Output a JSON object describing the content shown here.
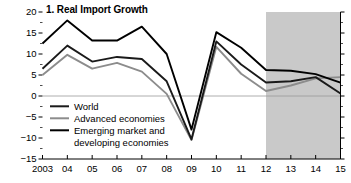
{
  "chart_data": {
    "type": "line",
    "title": "1. Real Import Growth",
    "xlabel": "",
    "ylabel": "",
    "x": [
      2003,
      2004,
      2005,
      2006,
      2007,
      2008,
      2009,
      2010,
      2011,
      2012,
      2013,
      2014,
      2015
    ],
    "xtick_labels": [
      "2003",
      "04",
      "05",
      "06",
      "07",
      "08",
      "09",
      "10",
      "11",
      "12",
      "13",
      "14",
      "15"
    ],
    "ytick_labels": [
      "20",
      "15",
      "10",
      "5",
      "0",
      "−5",
      "−10",
      "−15"
    ],
    "ytick_values": [
      20,
      15,
      10,
      5,
      0,
      -5,
      -10,
      -15
    ],
    "ylim": [
      -15,
      20
    ],
    "xlim": [
      2003,
      2015
    ],
    "grid": false,
    "minor_ticks": true,
    "legend_position": "inside-lower-left",
    "zero_line": true,
    "forecast_shading": {
      "label": "",
      "start": 2012,
      "end": 2015,
      "color": "#c9c9c9"
    },
    "series": [
      {
        "name": "World",
        "color": "#1a1a1a",
        "width": 1.9,
        "values": [
          6.5,
          12.0,
          8.2,
          9.3,
          8.8,
          3.5,
          -10.3,
          13.0,
          7.5,
          3.2,
          3.5,
          4.5,
          0.6
        ]
      },
      {
        "name": "Advanced economies",
        "color": "#8c8c8c",
        "width": 1.9,
        "values": [
          5.0,
          9.8,
          6.5,
          7.9,
          5.8,
          0.5,
          -10.5,
          11.7,
          5.3,
          1.2,
          2.5,
          4.2,
          4.5
        ]
      },
      {
        "name": "Emerging market and developing economies",
        "color": "#000000",
        "width": 1.9,
        "values": [
          12.5,
          18.0,
          13.2,
          13.2,
          16.5,
          10.0,
          -8.0,
          15.2,
          11.5,
          6.2,
          6.0,
          5.2,
          3.2
        ]
      }
    ],
    "legend_entries": [
      {
        "label": "World",
        "color": "#1a1a1a"
      },
      {
        "label": "Advanced economies",
        "color": "#8c8c8c"
      },
      {
        "label": "Emerging market and",
        "color": "#000000"
      },
      {
        "label": "developing economies",
        "color": ""
      }
    ]
  }
}
